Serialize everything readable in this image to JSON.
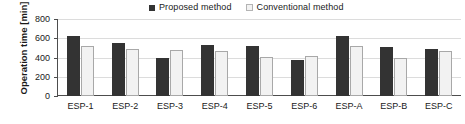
{
  "chart_data": {
    "type": "bar",
    "title": "",
    "xlabel": "",
    "ylabel": "Operation time [min]",
    "ylim": [
      0,
      800
    ],
    "ytick_interval": 200,
    "yticks": [
      800,
      600,
      400,
      200,
      0
    ],
    "grid": true,
    "legend_position": "top-center",
    "categories": [
      "ESP-1",
      "ESP-2",
      "ESP-3",
      "ESP-4",
      "ESP-5",
      "ESP-6",
      "ESP-A",
      "ESP-B",
      "ESP-C"
    ],
    "series": [
      {
        "name": "Proposed method",
        "color": "#333333",
        "values": [
          625,
          555,
          400,
          530,
          520,
          370,
          625,
          510,
          485
        ]
      },
      {
        "name": "Conventional method",
        "color": "#f2f2f2",
        "values": [
          520,
          490,
          475,
          470,
          405,
          415,
          520,
          400,
          470
        ]
      }
    ]
  },
  "legend": {
    "entries": [
      {
        "label": "Proposed method"
      },
      {
        "label": "Conventional method"
      }
    ]
  },
  "colors": {
    "proposed": "#333333",
    "conventional": "#f2f2f2",
    "conventional_border": "#a8a8a8",
    "axis": "#4d4d4d",
    "grid": "#dcdcdc",
    "background": "#ffffff"
  }
}
